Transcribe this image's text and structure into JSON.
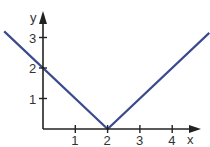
{
  "chart_data": {
    "type": "line",
    "title": "",
    "xlabel": "x",
    "ylabel": "y",
    "function": "y = |x - 2|",
    "series": [
      {
        "name": "y = |x - 2|",
        "color": "#3b4a8c",
        "x": [
          -1.2,
          2,
          5.15
        ],
        "y": [
          3.2,
          0,
          3.15
        ]
      }
    ],
    "x_ticks": [
      "1",
      "2",
      "3",
      "4"
    ],
    "y_ticks": [
      "1",
      "2",
      "3"
    ],
    "xlim": [
      -1.3,
      5.2
    ],
    "ylim": [
      -0.6,
      3.6
    ],
    "grid": false,
    "legend": "none"
  },
  "axes": {
    "x_label": "x",
    "y_label": "y",
    "x_ticks": [
      {
        "value": 1,
        "label": "1"
      },
      {
        "value": 2,
        "label": "2"
      },
      {
        "value": 3,
        "label": "3"
      },
      {
        "value": 4,
        "label": "4"
      }
    ],
    "y_ticks": [
      {
        "value": 1,
        "label": "1"
      },
      {
        "value": 2,
        "label": "2"
      },
      {
        "value": 3,
        "label": "3"
      }
    ]
  },
  "colors": {
    "line": "#3b4a8c",
    "axis": "#222222",
    "text": "#333333"
  }
}
